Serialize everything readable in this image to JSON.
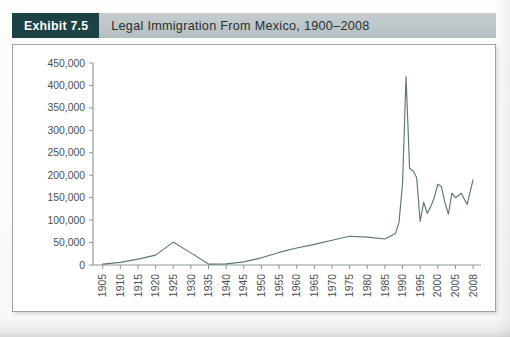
{
  "exhibit": {
    "badge_label": "Exhibit 7.5",
    "title": "Legal Immigration From Mexico, 1900–2008"
  },
  "chart_data": {
    "type": "line",
    "title": "Legal Immigration From Mexico, 1900–2008",
    "xlabel": "",
    "ylabel": "",
    "ylim": [
      0,
      450000
    ],
    "xlim": [
      1905,
      2008
    ],
    "grid": false,
    "legend_position": "none",
    "ytick_labels": [
      "0",
      "50,000",
      "100,000",
      "150,000",
      "200,000",
      "250,000",
      "300,000",
      "350,000",
      "400,000",
      "450,000"
    ],
    "ytick_values": [
      0,
      50000,
      100000,
      150000,
      200000,
      250000,
      300000,
      350000,
      400000,
      450000
    ],
    "xtick_labels": [
      "1905",
      "1910",
      "1915",
      "1920",
      "1925",
      "1930",
      "1935",
      "1940",
      "1945",
      "1950",
      "1955",
      "1960",
      "1965",
      "1970",
      "1975",
      "1980",
      "1985",
      "1990",
      "1995",
      "2000",
      "2005",
      "2008"
    ],
    "xtick_values": [
      1905,
      1910,
      1915,
      1920,
      1925,
      1930,
      1935,
      1940,
      1945,
      1950,
      1955,
      1960,
      1965,
      1970,
      1975,
      1980,
      1985,
      1990,
      1995,
      2000,
      2005,
      2008
    ],
    "series": [
      {
        "name": "Legal immigration from Mexico",
        "x": [
          1905,
          1910,
          1915,
          1920,
          1925,
          1930,
          1935,
          1940,
          1945,
          1950,
          1955,
          1960,
          1965,
          1970,
          1975,
          1980,
          1985,
          1988,
          1989,
          1990,
          1991,
          1992,
          1993,
          1994,
          1995,
          1996,
          1997,
          1998,
          1999,
          2000,
          2001,
          2002,
          2003,
          2004,
          2005,
          2006,
          2007,
          2008
        ],
        "values": [
          2000,
          6000,
          13000,
          22000,
          51000,
          27000,
          2000,
          2500,
          7000,
          16000,
          28000,
          38000,
          46000,
          55000,
          64000,
          62000,
          58000,
          70000,
          95000,
          180000,
          420000,
          215000,
          210000,
          195000,
          97000,
          140000,
          115000,
          130000,
          150000,
          180000,
          175000,
          140000,
          113000,
          160000,
          150000,
          160000,
          135000,
          190000
        ]
      }
    ],
    "annotations": []
  }
}
